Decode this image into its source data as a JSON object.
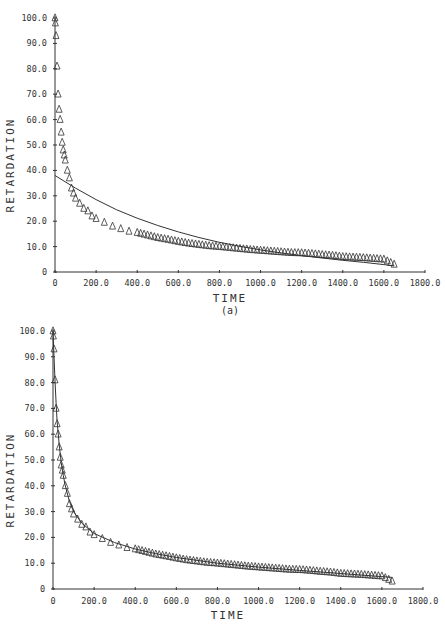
{
  "chart_data": [
    {
      "type": "scatter",
      "panel": "top",
      "caption": "(a)",
      "xlabel": "TIME",
      "ylabel": "RETARDATION",
      "xlim": [
        0,
        1800
      ],
      "ylim": [
        0,
        100
      ],
      "x_ticks": [
        "0",
        "200.0",
        "400.0",
        "600.0",
        "800.0",
        "1000.0",
        "1200.0",
        "1400.0",
        "1600.0",
        "1800.0"
      ],
      "y_ticks": [
        "0",
        "10.0",
        "20.0",
        "30.0",
        "40.0",
        "50.0",
        "60.0",
        "70.0",
        "80.0",
        "90.0",
        "100.0"
      ],
      "grid": false,
      "series": [
        {
          "name": "measured",
          "marker": "triangle-open",
          "x": [
            0,
            2,
            5,
            10,
            15,
            20,
            25,
            30,
            35,
            40,
            45,
            50,
            60,
            70,
            80,
            90,
            100,
            120,
            140,
            160,
            180,
            200,
            240,
            280,
            320,
            360,
            400,
            450,
            500,
            550,
            600,
            650,
            700,
            750,
            800,
            850,
            900,
            950,
            1000,
            1050,
            1100,
            1150,
            1200,
            1250,
            1300,
            1350,
            1400,
            1450,
            1500,
            1550,
            1600,
            1650
          ],
          "y": [
            100,
            98,
            93,
            81,
            70,
            64,
            60,
            55,
            51,
            48,
            46,
            44,
            40,
            37,
            33,
            31,
            29,
            27,
            25,
            24,
            22,
            21,
            19.5,
            18,
            17,
            16,
            15.5,
            14.5,
            13.5,
            12.8,
            12,
            11.3,
            10.8,
            10.3,
            10,
            9.6,
            9.2,
            8.8,
            8.5,
            8.2,
            7.9,
            7.6,
            7.5,
            7.2,
            6.8,
            6.5,
            6,
            5.8,
            5.6,
            5.3,
            5,
            3
          ]
        },
        {
          "name": "fit",
          "style": "line",
          "x": [
            0,
            100,
            200,
            300,
            400,
            500,
            600,
            700,
            800,
            900,
            1000,
            1100,
            1200,
            1300,
            1400,
            1500,
            1600,
            1650
          ],
          "y": [
            38,
            33,
            28.5,
            24.5,
            21.2,
            18.3,
            15.8,
            13.6,
            11.7,
            10.1,
            8.7,
            7.5,
            6.4,
            5.5,
            4.6,
            3.8,
            2.9,
            2.4
          ]
        }
      ]
    },
    {
      "type": "scatter",
      "panel": "bottom",
      "xlabel": "TIME",
      "ylabel": "RETARDATION",
      "xlim": [
        0,
        1800
      ],
      "ylim": [
        0,
        100
      ],
      "x_ticks": [
        "0",
        "200.0",
        "400.0",
        "600.0",
        "800.0",
        "1000.0",
        "1200.0",
        "1400.0",
        "1600.0",
        "1800.0"
      ],
      "y_ticks": [
        "0",
        "10.0",
        "20.0",
        "30.0",
        "40.0",
        "50.0",
        "60.0",
        "70.0",
        "80.0",
        "90.0",
        "100.0"
      ],
      "grid": false,
      "series": [
        {
          "name": "measured",
          "marker": "triangle-open",
          "x": [
            0,
            2,
            5,
            10,
            15,
            20,
            25,
            30,
            35,
            40,
            45,
            50,
            60,
            70,
            80,
            90,
            100,
            120,
            140,
            160,
            180,
            200,
            240,
            280,
            320,
            360,
            400,
            450,
            500,
            550,
            600,
            650,
            700,
            750,
            800,
            850,
            900,
            950,
            1000,
            1050,
            1100,
            1150,
            1200,
            1250,
            1300,
            1350,
            1400,
            1450,
            1500,
            1550,
            1600,
            1650
          ],
          "y": [
            100,
            98,
            93,
            81,
            70,
            64,
            60,
            55,
            51,
            48,
            46,
            44,
            40,
            37,
            33,
            31,
            29,
            27,
            25,
            24,
            22,
            21,
            19.5,
            18,
            17,
            16,
            15.5,
            14.5,
            13.5,
            12.8,
            12,
            11.3,
            10.8,
            10.3,
            10,
            9.6,
            9.2,
            8.8,
            8.5,
            8.2,
            7.9,
            7.6,
            7.5,
            7.2,
            6.8,
            6.5,
            6,
            5.8,
            5.6,
            5.3,
            5,
            3
          ]
        },
        {
          "name": "fit",
          "style": "line",
          "x": [
            0,
            5,
            10,
            15,
            20,
            30,
            40,
            50,
            60,
            80,
            100,
            140,
            200,
            300,
            400,
            500,
            600,
            800,
            1000,
            1200,
            1400,
            1600,
            1650
          ],
          "y": [
            100,
            90,
            80,
            72,
            65,
            56,
            49,
            44,
            40,
            34,
            30,
            25.5,
            21.5,
            18,
            15.5,
            13.7,
            12.2,
            10,
            8.5,
            7.2,
            6,
            4.8,
            4.5
          ]
        }
      ]
    }
  ]
}
